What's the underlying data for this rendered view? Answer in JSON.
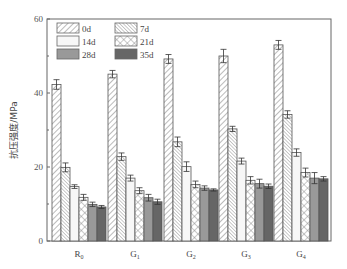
{
  "chart_data": {
    "type": "bar",
    "title": "",
    "xlabel": "",
    "ylabel": "抗压强度/MPa",
    "ylim": [
      0,
      60
    ],
    "yticks": [
      0,
      20,
      40,
      60
    ],
    "grid": false,
    "legend_position": "upper-left (inside, 2 columns)",
    "categories": [
      "R0",
      "G1",
      "G2",
      "G3",
      "G4"
    ],
    "category_labels": [
      {
        "base": "R",
        "sub": "0"
      },
      {
        "base": "G",
        "sub": "1"
      },
      {
        "base": "G",
        "sub": "2"
      },
      {
        "base": "G",
        "sub": "3"
      },
      {
        "base": "G",
        "sub": "4"
      }
    ],
    "series": [
      {
        "name": "0d",
        "pattern": "diag-right",
        "values": [
          42.3,
          45.1,
          49.2,
          50.0,
          53.0
        ],
        "errors": [
          1.3,
          1.0,
          1.2,
          1.8,
          1.2
        ]
      },
      {
        "name": "7d",
        "pattern": "diag-left-dense",
        "values": [
          19.9,
          22.8,
          26.8,
          30.3,
          34.2
        ],
        "errors": [
          1.2,
          1.0,
          1.3,
          0.7,
          1.0
        ]
      },
      {
        "name": "14d",
        "pattern": "light",
        "values": [
          14.7,
          17.0,
          20.1,
          21.6,
          23.9
        ],
        "errors": [
          0.5,
          0.8,
          1.3,
          0.8,
          1.0
        ]
      },
      {
        "name": "21d",
        "pattern": "crosshatch",
        "values": [
          11.8,
          13.6,
          15.3,
          16.4,
          18.5
        ],
        "errors": [
          0.8,
          0.8,
          0.9,
          1.0,
          1.2
        ]
      },
      {
        "name": "28d",
        "pattern": "gray",
        "values": [
          9.9,
          11.7,
          14.3,
          15.5,
          17.0
        ],
        "errors": [
          0.6,
          0.9,
          0.6,
          1.2,
          1.5
        ]
      },
      {
        "name": "35d",
        "pattern": "dark",
        "values": [
          9.2,
          10.6,
          13.8,
          14.8,
          16.8
        ],
        "errors": [
          0.4,
          0.7,
          0.3,
          0.6,
          0.6
        ]
      }
    ]
  },
  "legend": {
    "items": [
      "0d",
      "7d",
      "14d",
      "21d",
      "28d",
      "35d"
    ]
  }
}
